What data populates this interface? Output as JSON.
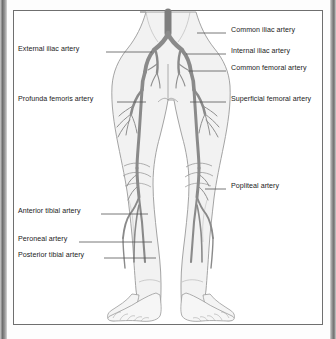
{
  "figure": {
    "colors": {
      "artery": "#8a8a8a",
      "artery_dark": "#6f6f6f",
      "body_fill": "#f2f2f2",
      "body_outline": "#9a9a9a",
      "leader": "#555555",
      "frame": "#6f6f6f",
      "text": "#1b1b1b",
      "page": "#ffffff"
    }
  },
  "labels_left": [
    {
      "text": "External iliac artery",
      "x": 18,
      "y": 50,
      "line_x1": 106,
      "line_x2": 152,
      "line_y": 52
    },
    {
      "text": "Profunda femoris artery",
      "x": 18,
      "y": 100,
      "line_x1": 117,
      "line_x2": 146,
      "line_y": 102
    },
    {
      "text": "Anterior tibial artery",
      "x": 18,
      "y": 212,
      "line_x1": 101,
      "line_x2": 148,
      "line_y": 214
    },
    {
      "text": "Peroneal artery",
      "x": 18,
      "y": 240,
      "line_x1": 79,
      "line_x2": 152,
      "line_y": 242
    },
    {
      "text": "Posterior tibial artery",
      "x": 18,
      "y": 256,
      "line_x1": 104,
      "line_x2": 156,
      "line_y": 258
    }
  ],
  "labels_right": [
    {
      "text": "Common iliac artery",
      "x": 231,
      "y": 31,
      "line_x1": 197,
      "line_x2": 226,
      "line_y": 33
    },
    {
      "text": "Internal iliac artery",
      "x": 231,
      "y": 52,
      "line_x1": 186,
      "line_x2": 226,
      "line_y": 54
    },
    {
      "text": "Common femoral artery",
      "x": 231,
      "y": 69,
      "line_x1": 188,
      "line_x2": 226,
      "line_y": 71
    },
    {
      "text": "Superficial femoral artery",
      "x": 231,
      "y": 100,
      "line_x1": 190,
      "line_x2": 226,
      "line_y": 102
    },
    {
      "text": "Popliteal artery",
      "x": 231,
      "y": 187,
      "line_x1": 205,
      "line_x2": 226,
      "line_y": 189
    }
  ]
}
